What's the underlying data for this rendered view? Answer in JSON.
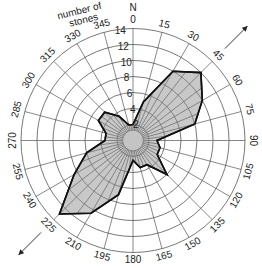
{
  "diagram": {
    "type": "rose-diagram",
    "north_label": "N",
    "radial_axis_title": [
      "number of",
      "stones"
    ],
    "ring_values": [
      2,
      4,
      6,
      8,
      10,
      12,
      14
    ],
    "bearing_labels": [
      0,
      15,
      30,
      45,
      60,
      75,
      90,
      105,
      120,
      135,
      150,
      165,
      180,
      195,
      210,
      225,
      240,
      255,
      270,
      285,
      300,
      315,
      330,
      345
    ],
    "fill_color": "#c8c8c8",
    "outline_color": "#111111",
    "grid_color": "#555555",
    "center_disc_radius_stones": 1.3,
    "arrows": [
      {
        "name": "ne-arrow",
        "bearing": 45
      },
      {
        "name": "sw-arrow",
        "bearing": 225
      }
    ]
  },
  "chart_data": {
    "type": "rose",
    "title": "",
    "radial_label": "number of stones",
    "radial_range": [
      0,
      14
    ],
    "angular_unit": "degrees (bearing from N)",
    "categories": [
      0,
      15,
      30,
      45,
      60,
      75,
      90,
      105,
      120,
      135,
      150,
      165,
      180,
      195,
      210,
      225,
      240,
      255,
      270,
      285,
      300,
      315,
      330,
      345
    ],
    "values": [
      2,
      5,
      10,
      12,
      10,
      8,
      3,
      3.5,
      3.5,
      6,
      3.5,
      3.5,
      2.5,
      7,
      10.5,
      13,
      8.5,
      6,
      3.5,
      3.5,
      5,
      5,
      3.5,
      2
    ]
  }
}
